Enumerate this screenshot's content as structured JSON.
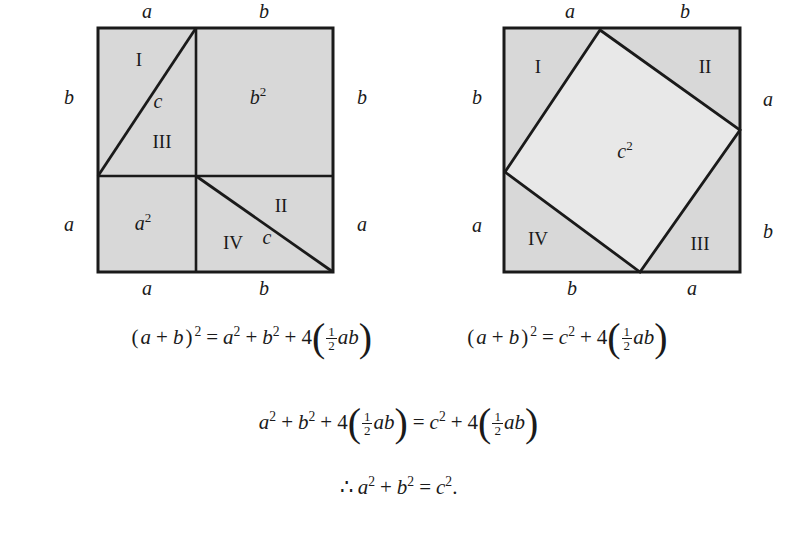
{
  "figure": {
    "colors": {
      "shaded_fill": "#d8d8d8",
      "inner_square_fill": "#e8e8e8",
      "stroke": "#1a1a1a",
      "background": "#ffffff",
      "text": "#1a1a1a"
    },
    "left_diagram": {
      "name": "dissection-square-left",
      "outer_labels": {
        "top_left": "a",
        "top_right": "b",
        "left_upper": "b",
        "left_lower": "a",
        "right_upper": "b",
        "right_lower": "a",
        "bottom_left": "a",
        "bottom_right": "b"
      },
      "region_labels": {
        "triangle_I": "I",
        "triangle_III": "III",
        "triangle_II": "II",
        "triangle_IV": "IV",
        "hypotenuse_upper": "c",
        "hypotenuse_lower": "c"
      },
      "area_labels": {
        "small_square": "a",
        "small_square_exp": "2",
        "large_square": "b",
        "large_square_exp": "2"
      }
    },
    "right_diagram": {
      "name": "dissection-square-right",
      "outer_labels": {
        "top_left": "a",
        "top_right": "b",
        "left_upper": "b",
        "left_lower": "a",
        "right_upper": "a",
        "right_lower": "b",
        "bottom_left": "b",
        "bottom_right": "a"
      },
      "region_labels": {
        "triangle_I": "I",
        "triangle_II": "II",
        "triangle_III": "III",
        "triangle_IV": "IV"
      },
      "area_labels": {
        "inner_square": "c",
        "inner_square_exp": "2"
      }
    }
  },
  "equations": {
    "line1_left": {
      "name": "equation-left-expansion",
      "text": "(a + b)² = a² + b² + 4(½ab)",
      "tokens": {
        "open": "(",
        "a": "a",
        "plus1": "+",
        "b": "b",
        "close": ")",
        "sup2": "2",
        "eq": "=",
        "a2": "a",
        "a2sup": "2",
        "plus2": "+",
        "b2": "b",
        "b2sup": "2",
        "plus3": "+",
        "four": "4",
        "lparen": "(",
        "num": "1",
        "den": "2",
        "ab": "ab",
        "rparen": ")"
      }
    },
    "line1_right": {
      "name": "equation-right-expansion",
      "text": "(a + b)² = c² + 4(½ab)",
      "tokens": {
        "open": "(",
        "a": "a",
        "plus1": "+",
        "b": "b",
        "close": ")",
        "sup2": "2",
        "eq": "=",
        "c2": "c",
        "c2sup": "2",
        "plus3": "+",
        "four": "4",
        "lparen": "(",
        "num": "1",
        "den": "2",
        "ab": "ab",
        "rparen": ")"
      }
    },
    "line2": {
      "name": "equation-combined",
      "text": "a² + b² + 4(½ab) = c² + 4(½ab)",
      "tokens": {
        "a": "a",
        "asup": "2",
        "plus1": "+",
        "b": "b",
        "bsup": "2",
        "plus2": "+",
        "four1": "4",
        "lparen1": "(",
        "num1": "1",
        "den1": "2",
        "ab1": "ab",
        "rparen1": ")",
        "eq": "=",
        "c": "c",
        "csup": "2",
        "plus3": "+",
        "four2": "4",
        "lparen2": "(",
        "num2": "1",
        "den2": "2",
        "ab2": "ab",
        "rparen2": ")"
      }
    },
    "line3": {
      "name": "equation-conclusion",
      "text": "∴ a² + b² = c².",
      "tokens": {
        "therefore": "∴",
        "a": "a",
        "asup": "2",
        "plus": "+",
        "b": "b",
        "bsup": "2",
        "eq": "=",
        "c": "c",
        "csup": "2",
        "period": "."
      }
    }
  }
}
